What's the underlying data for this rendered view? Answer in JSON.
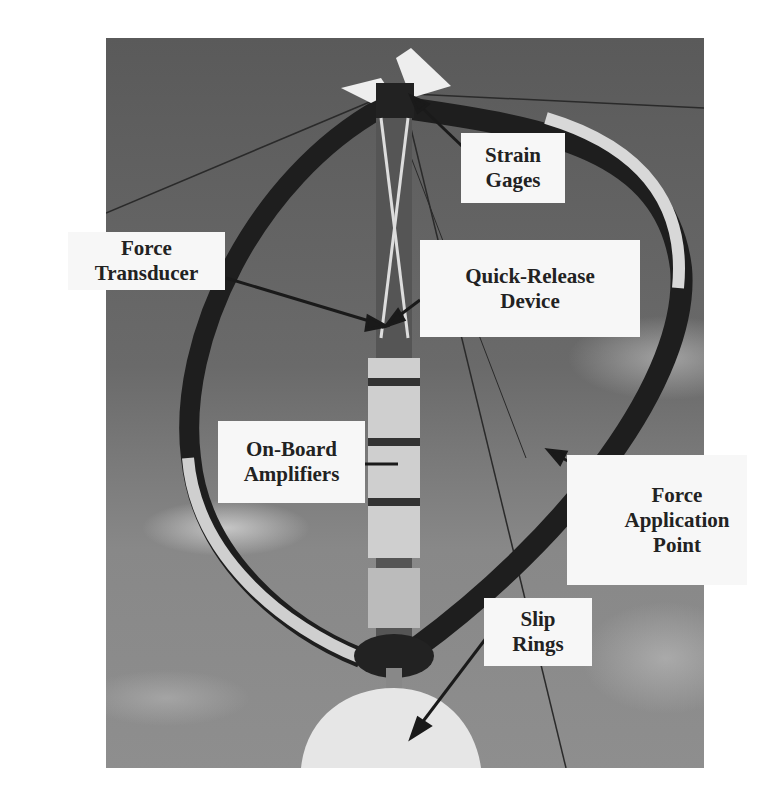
{
  "figure": {
    "labels": {
      "strain_gages": [
        "Strain",
        "Gages"
      ],
      "force_transducer": [
        "Force",
        "Transducer"
      ],
      "quick_release": [
        "Quick-Release",
        "Device"
      ],
      "amplifiers": [
        "On-Board",
        "Amplifiers"
      ],
      "force_application": [
        "Force",
        "Application",
        "Point"
      ],
      "slip_rings": [
        "Slip",
        "Rings"
      ]
    }
  }
}
